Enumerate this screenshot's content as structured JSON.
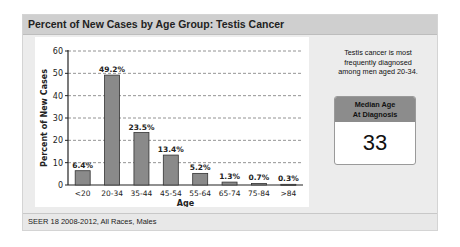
{
  "panel": {
    "title": "Percent of New Cases by Age Group: Testis Cancer",
    "footer": "SEER 18 2008-2012, All Races, Males"
  },
  "side": {
    "note_lines": [
      "Testis cancer is most",
      "frequently diagnosed",
      "among men aged 20-34."
    ],
    "median_label_lines": [
      "Median Age",
      "At Diagnosis"
    ],
    "median_value": "33"
  },
  "chart_data": {
    "type": "bar",
    "title": "Percent of New Cases by Age Group: Testis Cancer",
    "xlabel": "Age",
    "ylabel": "Percent of New Cases",
    "categories": [
      "<20",
      "20-34",
      "35-44",
      "45-54",
      "55-64",
      "65-74",
      "75-84",
      ">84"
    ],
    "values": [
      6.4,
      49.2,
      23.5,
      13.4,
      5.2,
      1.3,
      0.7,
      0.3
    ],
    "data_labels": [
      "6.4%",
      "49.2%",
      "23.5%",
      "13.4%",
      "5.2%",
      "1.3%",
      "0.7%",
      "0.3%"
    ],
    "ylim": [
      0,
      60
    ],
    "yticks": [
      0,
      10,
      20,
      30,
      40,
      50,
      60
    ],
    "grid": "horizontal dashed",
    "bar_color": "#8a8a8a",
    "legend": null
  }
}
